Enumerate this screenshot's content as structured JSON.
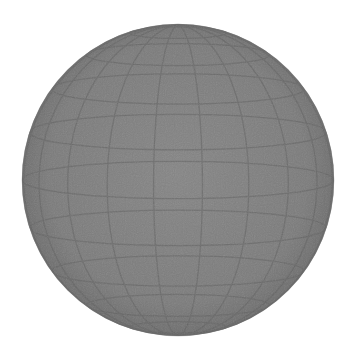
{
  "image": {
    "subject": "gray sphere with latitude/longitude grid",
    "background_color": "#ffffff",
    "sphere": {
      "center_x": 178,
      "center_y": 180,
      "radius": 156,
      "fill_color": "#7d7d7d",
      "highlight_color": "#868686",
      "rim_color": "#6a6a6a",
      "grid_color": "#5f5f5f",
      "latitude_lines": 10,
      "longitude_lines": 10
    }
  }
}
